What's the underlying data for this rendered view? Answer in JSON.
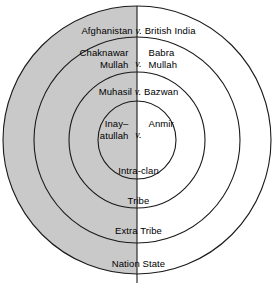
{
  "diagram": {
    "type": "concentric-circles",
    "center": {
      "x": 137,
      "y": 140
    },
    "shaded_half": "left",
    "colors": {
      "shade": "#c9c9c9",
      "stroke": "#1a1a1a",
      "background": "#ffffff",
      "text": "#000000"
    },
    "axis": {
      "orientation": "vertical",
      "x": 137,
      "y_top": 6,
      "y_bottom": 283
    },
    "rings": [
      {
        "index": 0,
        "name": "nation-state",
        "radius": 134,
        "level_label": "Nation State",
        "dispute": {
          "layout": "single-line",
          "left": "Afghanistan",
          "vs": "v.",
          "right": "British India",
          "full": "Afghanistan v. British India"
        }
      },
      {
        "index": 1,
        "name": "extra-tribe",
        "radius": 103,
        "level_label": "Extra Tribe",
        "dispute": {
          "layout": "two-line-split",
          "left_line1": "Chaknawar",
          "left_line2": "Mullah",
          "vs": "v.",
          "right_line1": "Babra",
          "right_line2": "Mullah",
          "full": "Chaknawar Mullah v. Babra Mullah"
        }
      },
      {
        "index": 2,
        "name": "tribe",
        "radius": 68,
        "level_label": "Tribe",
        "dispute": {
          "layout": "single-line",
          "left": "Muhasil",
          "vs": "v.",
          "right": "Bazwan",
          "full": "Muhasil v. Bazwan"
        }
      },
      {
        "index": 3,
        "name": "intra-clan",
        "radius": 39,
        "level_label": "Intra-clan",
        "dispute": {
          "layout": "two-line-split",
          "left_line1": "Inay–",
          "left_line2": "atullah",
          "vs": "v.",
          "right_line1": "",
          "right_line2": "Anmir",
          "full": "Inay–atullah v. Anmir"
        }
      }
    ]
  }
}
